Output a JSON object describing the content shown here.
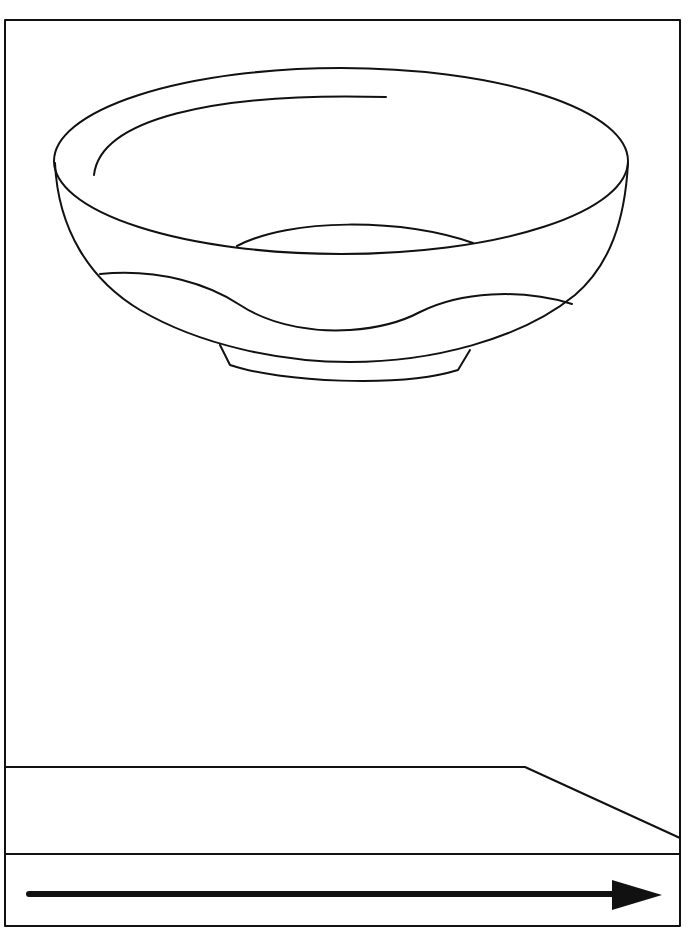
{
  "diagram": {
    "stroke_color": "#111111",
    "background": "#ffffff",
    "elements": [
      {
        "name": "frame",
        "type": "rectangle"
      },
      {
        "name": "bowl",
        "type": "object",
        "parts": [
          "rim-ellipse",
          "highlight-arc",
          "inner-bottom-arc",
          "bowl-body",
          "wave-band",
          "foot-ring"
        ]
      },
      {
        "name": "table-surface",
        "type": "perspective-plane"
      },
      {
        "name": "direction-arrow",
        "type": "arrow",
        "direction": "right"
      }
    ]
  }
}
